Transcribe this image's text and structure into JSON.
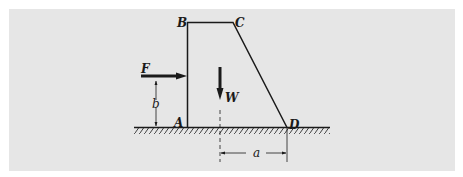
{
  "figure": {
    "type": "free-body diagram",
    "colors": {
      "background": "#e6e6e6",
      "ink": "#1a1a1a",
      "page": "#ffffff"
    }
  },
  "points": {
    "A": "A",
    "B": "B",
    "C": "C",
    "D": "D"
  },
  "forces": {
    "horizontal": "F",
    "weight": "W"
  },
  "dimensions": {
    "height_of_F": "b",
    "lever_arm_W": "a"
  }
}
